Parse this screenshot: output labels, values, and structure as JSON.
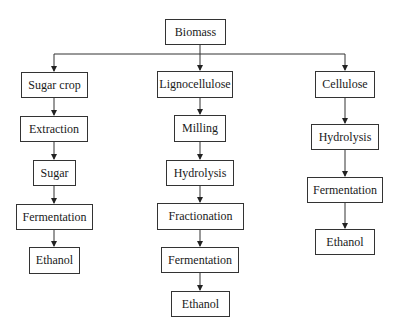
{
  "diagram": {
    "type": "flowchart",
    "root": {
      "label": "Biomass"
    },
    "branches": [
      {
        "name": "sugar-crop",
        "steps": [
          "Sugar crop",
          "Extraction",
          "Sugar",
          "Fermentation",
          "Ethanol"
        ]
      },
      {
        "name": "lignocellulose",
        "steps": [
          "Lignocellulose",
          "Milling",
          "Hydrolysis",
          "Fractionation",
          "Fermentation",
          "Ethanol"
        ]
      },
      {
        "name": "cellulose",
        "steps": [
          "Cellulose",
          "Hydrolysis",
          "Fermentation",
          "Ethanol"
        ]
      }
    ],
    "colors": {
      "line": "#333333",
      "border": "#333333",
      "text": "#1a1a1a",
      "background": "#ffffff"
    }
  }
}
